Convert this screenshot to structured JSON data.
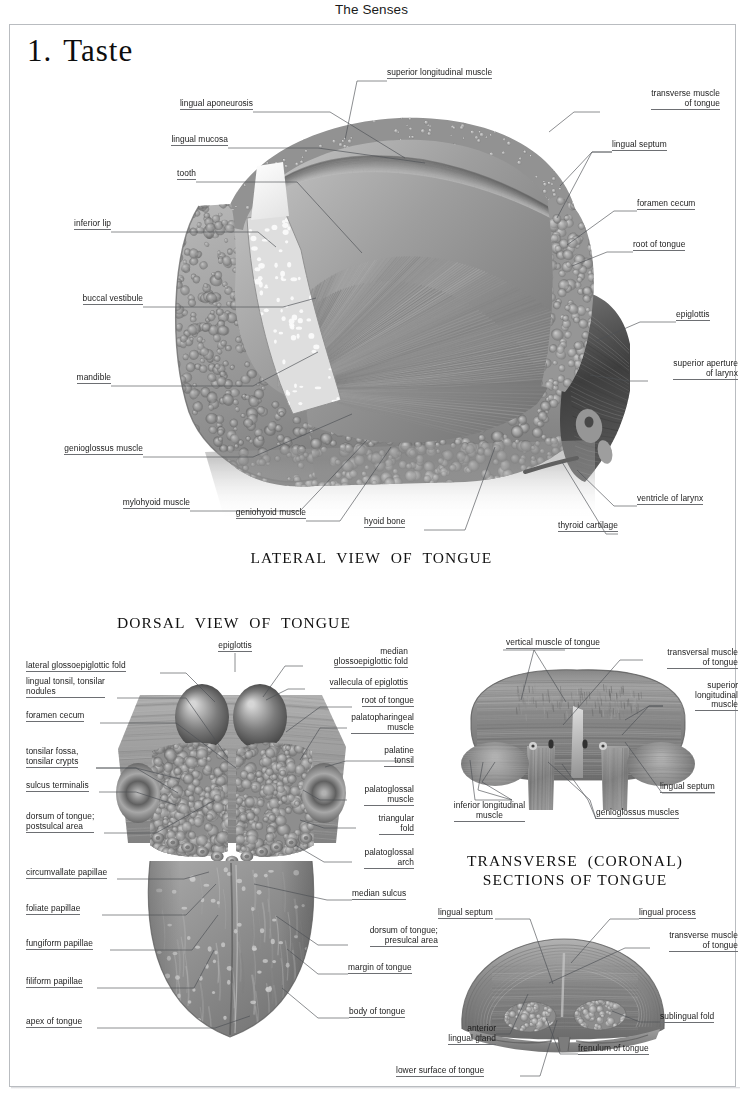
{
  "header": {
    "running_head": "The Senses"
  },
  "chapter": {
    "number": "1.",
    "title": "Taste"
  },
  "figures": [
    {
      "id": "lateral",
      "caption": "LATERAL  VIEW  OF  TONGUE",
      "labels_left": [
        "lingual aponeurosis",
        "lingual mucosa",
        "tooth",
        "inferior lip",
        "buccal vestibule",
        "mandible",
        "genioglossus muscle",
        "mylohyoid muscle",
        "geniohyoid muscle"
      ],
      "labels_top": [
        "superior longitudinal muscle"
      ],
      "labels_bottom": [
        "hyoid bone",
        "thyroid cartilage"
      ],
      "labels_right": [
        "transverse muscle\nof tongue",
        "lingual septum",
        "foramen cecum",
        "root of tongue",
        "epiglottis",
        "superior aperture\nof larynx",
        "ventricle of larynx"
      ]
    },
    {
      "id": "dorsal",
      "caption": "DORSAL  VIEW  OF  TONGUE",
      "labels_top": [
        "epiglottis"
      ],
      "labels_left": [
        "lateral glossoepiglottic fold",
        "lingual tonsil, tonsilar\nnodules",
        "foramen cecum",
        "tonsilar fossa,\ntonsilar crypts",
        "sulcus terminalis",
        "dorsum of tongue;\npostsulcal area",
        "circumvallate papillae",
        "foliate papillae",
        "fungiform papillae",
        "filiform papillae",
        "apex of tongue"
      ],
      "labels_right": [
        "median\nglossoepiglottic fold",
        "vallecula of epiglottis",
        "root of tongue",
        "palatopharingeal\nmuscle",
        "palatine\ntonsil",
        "palatoglossal\nmuscle",
        "triangular\nfold",
        "palatoglossal\narch",
        "median sulcus",
        "dorsum of tongue;\npresulcal area",
        "margin of tongue",
        "body of tongue"
      ]
    },
    {
      "id": "coronal-upper",
      "caption": "TRANSVERSE  (CORONAL)\nSECTIONS OF TONGUE",
      "labels_top": [
        "vertical muscle of tongue"
      ],
      "labels_right": [
        "transversal muscle\nof tongue",
        "superior\nlongitudinal\nmuscle",
        "lingual septum"
      ],
      "labels_bottom": [
        "inferior longitudinal\nmuscle",
        "genioglossus muscles"
      ]
    },
    {
      "id": "coronal-lower",
      "labels_top": [
        "lingual septum",
        "lingual process"
      ],
      "labels_right": [
        "transverse muscle\nof tongue",
        "sublingual fold"
      ],
      "labels_bottom": [
        "anterior\nlingual gland",
        "lower surface of tongue",
        "frenulum of tongue"
      ]
    }
  ],
  "colors": {
    "page_background": "#ffffff",
    "frame_border": "#b9bcc0",
    "text": "#1b1b1b",
    "leader_line": "#4e5155",
    "art_mid_gray": "#8c8f93",
    "art_dark_gray": "#4a4d51",
    "art_light_gray": "#cfd1d3"
  }
}
